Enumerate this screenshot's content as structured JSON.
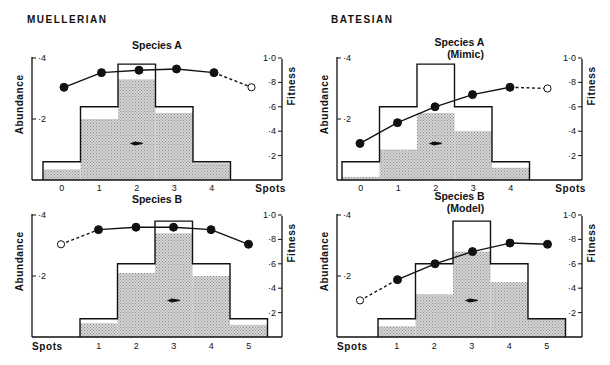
{
  "sections": {
    "mullerian": {
      "title": "MUELLERIAN"
    },
    "batesian": {
      "title": "BATESIAN"
    }
  },
  "axes": {
    "left_label": "Abundance",
    "right_label": "Fitness",
    "x_label": "Spots",
    "left_ticks": [
      "·4",
      "·2"
    ],
    "right_ticks": [
      "1·0",
      "·8",
      "·6",
      "·4",
      "·2"
    ]
  },
  "chart_data": [
    {
      "id": "mullerian-a",
      "type": "bar+line",
      "section": "MUELLERIAN",
      "title": "Species A",
      "subtitle": "",
      "xlabel": "Spots",
      "ylabel": "Abundance",
      "y2label": "Fitness",
      "categories": [
        "0",
        "1",
        "2",
        "3",
        "4"
      ],
      "series": [
        {
          "name": "Abundance (outline, initial)",
          "values": [
            0.06,
            0.24,
            0.38,
            0.24,
            0.06
          ]
        },
        {
          "name": "Abundance (shaded, after selection)",
          "values": [
            0.035,
            0.2,
            0.33,
            0.22,
            0.055
          ]
        },
        {
          "name": "Fitness",
          "x": [
            0,
            1,
            2,
            3,
            4,
            5
          ],
          "values": [
            0.76,
            0.88,
            0.9,
            0.91,
            0.88,
            0.76
          ],
          "open_points": [
            5
          ],
          "dashed_segments": [
            [
              4,
              5
            ]
          ]
        }
      ],
      "arrow": {
        "at_category": "2",
        "direction": "none"
      },
      "ylim": [
        0,
        0.4
      ],
      "y2lim": [
        0,
        1.0
      ]
    },
    {
      "id": "batesian-a",
      "type": "bar+line",
      "section": "BATESIAN",
      "title": "Species A",
      "subtitle": "(Mimic)",
      "xlabel": "Spots",
      "ylabel": "Abundance",
      "y2label": "Fitness",
      "categories": [
        "0",
        "1",
        "2",
        "3",
        "4"
      ],
      "series": [
        {
          "name": "Abundance (outline, initial)",
          "values": [
            0.06,
            0.24,
            0.38,
            0.24,
            0.06
          ]
        },
        {
          "name": "Abundance (shaded, after selection)",
          "values": [
            0.01,
            0.1,
            0.22,
            0.16,
            0.04
          ]
        },
        {
          "name": "Fitness",
          "x": [
            0,
            1,
            2,
            3,
            4,
            5
          ],
          "values": [
            0.3,
            0.47,
            0.6,
            0.7,
            0.76,
            0.75
          ],
          "open_points": [
            5
          ],
          "dashed_segments": [
            [
              4,
              5
            ]
          ]
        }
      ],
      "arrow": {
        "at_category": "2",
        "direction": "left"
      },
      "ylim": [
        0,
        0.4
      ],
      "y2lim": [
        0,
        1.0
      ]
    },
    {
      "id": "mullerian-b",
      "type": "bar+line",
      "section": "MUELLERIAN",
      "title": "Species B",
      "subtitle": "",
      "xlabel": "Spots",
      "ylabel": "Abundance",
      "y2label": "Fitness",
      "categories": [
        "1",
        "2",
        "3",
        "4",
        "5"
      ],
      "series": [
        {
          "name": "Abundance (outline, initial)",
          "values": [
            0.06,
            0.24,
            0.38,
            0.24,
            0.06
          ]
        },
        {
          "name": "Abundance (shaded, after selection)",
          "values": [
            0.045,
            0.21,
            0.34,
            0.2,
            0.04
          ]
        },
        {
          "name": "Fitness",
          "x": [
            0,
            1,
            2,
            3,
            4,
            5
          ],
          "values": [
            0.76,
            0.88,
            0.9,
            0.9,
            0.88,
            0.76
          ],
          "open_points": [
            0
          ],
          "dashed_segments": [
            [
              0,
              1
            ]
          ]
        }
      ],
      "arrow": {
        "at_category": "3",
        "direction": "none"
      },
      "ylim": [
        0,
        0.4
      ],
      "y2lim": [
        0,
        1.0
      ]
    },
    {
      "id": "batesian-b",
      "type": "bar+line",
      "section": "BATESIAN",
      "title": "Species B",
      "subtitle": "(Model)",
      "xlabel": "Spots",
      "ylabel": "Abundance",
      "y2label": "Fitness",
      "categories": [
        "1",
        "2",
        "3",
        "4",
        "5"
      ],
      "series": [
        {
          "name": "Abundance (outline, initial)",
          "values": [
            0.06,
            0.24,
            0.38,
            0.24,
            0.06
          ]
        },
        {
          "name": "Abundance (shaded, after selection)",
          "values": [
            0.035,
            0.14,
            0.28,
            0.18,
            0.06
          ]
        },
        {
          "name": "Fitness",
          "x": [
            0,
            1,
            2,
            3,
            4,
            5
          ],
          "values": [
            0.3,
            0.47,
            0.6,
            0.7,
            0.77,
            0.76
          ],
          "open_points": [
            0
          ],
          "dashed_segments": [
            [
              0,
              1
            ]
          ]
        }
      ],
      "arrow": {
        "at_category": "3",
        "direction": "left"
      },
      "ylim": [
        0,
        0.4
      ],
      "y2lim": [
        0,
        1.0
      ]
    }
  ]
}
